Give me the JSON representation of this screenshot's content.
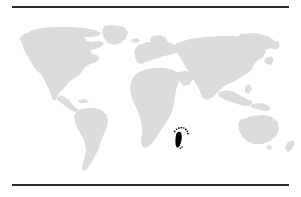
{
  "figure": {
    "type": "world-distribution-map",
    "projection": "equirectangular",
    "title": "",
    "caption": "",
    "background_color": "#ffffff",
    "land_color": "#dcdcdc",
    "ocean_color": "#ffffff",
    "range_color": "#000000",
    "rule_color": "#2b2b2b"
  },
  "rules": {
    "top_label": "top-divider-rule",
    "bottom_label": "bottom-divider-rule"
  },
  "map": {
    "land_regions": [
      {
        "name": "north-america"
      },
      {
        "name": "greenland"
      },
      {
        "name": "central-america"
      },
      {
        "name": "south-america"
      },
      {
        "name": "europe"
      },
      {
        "name": "africa"
      },
      {
        "name": "asia"
      },
      {
        "name": "southeast-asia-islands"
      },
      {
        "name": "australia"
      },
      {
        "name": "new-zealand"
      },
      {
        "name": "japan"
      },
      {
        "name": "british-isles"
      },
      {
        "name": "iceland"
      }
    ],
    "distribution": {
      "label": "species-occurrence-range",
      "color": "#000000",
      "primary_region": "madagascar",
      "island_points": [
        {
          "name": "comoros-north-1"
        },
        {
          "name": "comoros-north-2"
        },
        {
          "name": "comoros-north-3"
        },
        {
          "name": "seychelles-1"
        },
        {
          "name": "seychelles-2"
        },
        {
          "name": "aldabra"
        },
        {
          "name": "mascarene-mauritius"
        },
        {
          "name": "mascarene-reunion"
        },
        {
          "name": "south-point-1"
        },
        {
          "name": "south-point-2"
        }
      ]
    }
  }
}
